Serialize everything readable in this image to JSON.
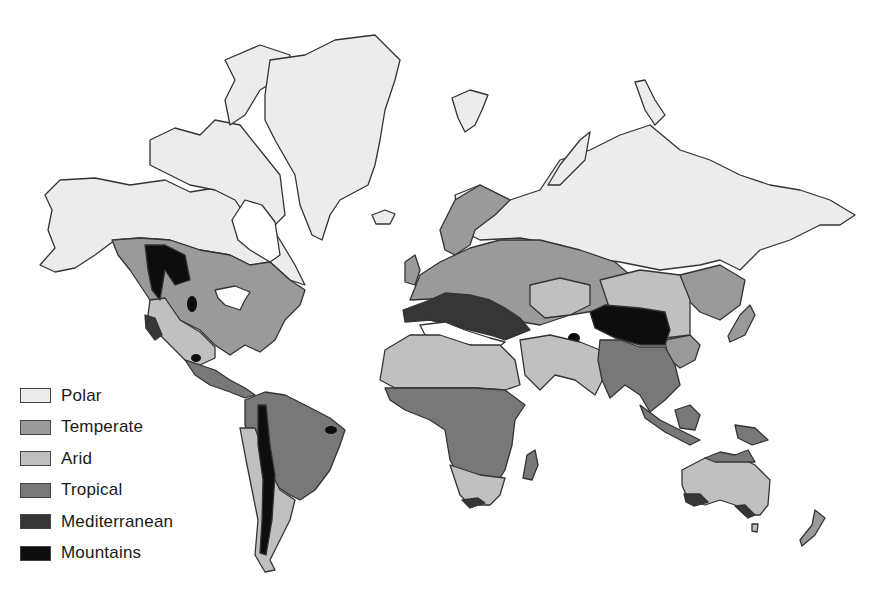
{
  "map": {
    "title": "",
    "type": "world climate zones",
    "legend": [
      {
        "label": "Polar",
        "color": "#ececec"
      },
      {
        "label": "Temperate",
        "color": "#9a9a9a"
      },
      {
        "label": "Arid",
        "color": "#c0c0c0"
      },
      {
        "label": "Tropical",
        "color": "#787878"
      },
      {
        "label": "Mediterranean",
        "color": "#363636"
      },
      {
        "label": "Mountains",
        "color": "#0d0d0d"
      }
    ],
    "regions": [
      {
        "name": "North America north",
        "zone": "Polar"
      },
      {
        "name": "Greenland",
        "zone": "Polar"
      },
      {
        "name": "Northern Eurasia",
        "zone": "Polar"
      },
      {
        "name": "North America central/east",
        "zone": "Temperate"
      },
      {
        "name": "Europe",
        "zone": "Temperate"
      },
      {
        "name": "Eastern China",
        "zone": "Temperate"
      },
      {
        "name": "Western North America interior",
        "zone": "Arid"
      },
      {
        "name": "North Africa / Middle East",
        "zone": "Arid"
      },
      {
        "name": "Central Asia",
        "zone": "Arid"
      },
      {
        "name": "Australia interior",
        "zone": "Arid"
      },
      {
        "name": "Central America",
        "zone": "Tropical"
      },
      {
        "name": "South America north",
        "zone": "Tropical"
      },
      {
        "name": "Central Africa",
        "zone": "Tropical"
      },
      {
        "name": "South / Southeast Asia",
        "zone": "Tropical"
      },
      {
        "name": "Mediterranean basin",
        "zone": "Mediterranean"
      },
      {
        "name": "California coast",
        "zone": "Mediterranean"
      },
      {
        "name": "South Africa cape",
        "zone": "Mediterranean"
      },
      {
        "name": "Southern Australia",
        "zone": "Mediterranean"
      },
      {
        "name": "Rocky Mountains",
        "zone": "Mountains"
      },
      {
        "name": "Andes",
        "zone": "Mountains"
      },
      {
        "name": "Tibetan Plateau",
        "zone": "Mountains"
      }
    ]
  }
}
